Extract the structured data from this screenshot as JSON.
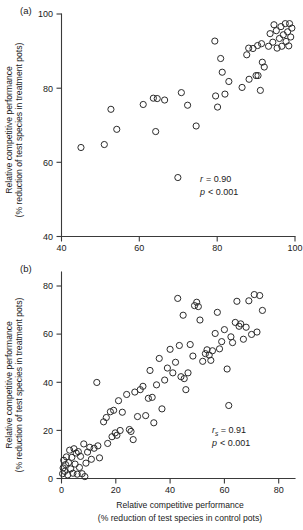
{
  "figure": {
    "type": "scatter-figure",
    "panels": [
      {
        "label": "(a)",
        "ylabel_line1": "Relative competitive performance",
        "ylabel_line2": "(% reduction of test species in treatment pots)",
        "stat_symbol": "r",
        "stat_sub": "",
        "stat_value": "= 0.90",
        "stat_line1": "r = 0.90",
        "stat_line2": "p < 0.001",
        "p_symbol": "p",
        "p_value": "< 0.001",
        "xticks": [
          "40",
          "60",
          "80",
          "100"
        ],
        "yticks": [
          "40",
          "60",
          "80",
          "100"
        ]
      },
      {
        "label": "(b)",
        "ylabel_line1": "Relative competitive performance",
        "ylabel_line2": "(% reduction of test species in treatment pots)",
        "xlabel_line1": "Relative competitive performance",
        "xlabel_line2": "(% reduction of test species in control pots)",
        "stat_symbol": "r",
        "stat_sub": "s",
        "stat_value": "= 0.91",
        "stat_line1": "rs = 0.91",
        "stat_line2": "p < 0.001",
        "p_symbol": "p",
        "p_value": "< 0.001",
        "xticks": [
          "0",
          "20",
          "40",
          "60",
          "80"
        ],
        "yticks": [
          "0",
          "20",
          "40",
          "60",
          "80"
        ]
      }
    ]
  },
  "chart_data": [
    {
      "type": "scatter",
      "panel": "(a)",
      "title": "",
      "xlabel": "Relative competitive performance (% reduction of test species in control pots)",
      "ylabel": "Relative competitive performance (% reduction of test species in treatment pots)",
      "xlim": [
        40,
        100
      ],
      "ylim": [
        40,
        100
      ],
      "xticks": [
        40,
        60,
        80,
        100
      ],
      "yticks": [
        40,
        60,
        80,
        100
      ],
      "grid": false,
      "legend": "none",
      "marker": "open-circle",
      "annotations": [
        "r = 0.90",
        "p < 0.001"
      ],
      "points": [
        [
          45.0,
          64.0
        ],
        [
          51.0,
          64.8
        ],
        [
          52.7,
          74.3
        ],
        [
          54.2,
          68.9
        ],
        [
          61.0,
          75.6
        ],
        [
          63.6,
          77.3
        ],
        [
          64.6,
          77.2
        ],
        [
          64.2,
          68.3
        ],
        [
          66.5,
          76.8
        ],
        [
          69.9,
          55.9
        ],
        [
          70.8,
          78.8
        ],
        [
          72.4,
          75.4
        ],
        [
          74.6,
          69.8
        ],
        [
          79.4,
          92.7
        ],
        [
          79.6,
          77.9
        ],
        [
          80.1,
          74.9
        ],
        [
          80.9,
          88.0
        ],
        [
          81.3,
          84.3
        ],
        [
          82.0,
          78.4
        ],
        [
          83.0,
          81.8
        ],
        [
          86.4,
          80.2
        ],
        [
          87.6,
          89.0
        ],
        [
          88.2,
          82.4
        ],
        [
          88.1,
          90.8
        ],
        [
          89.2,
          90.7
        ],
        [
          90.0,
          83.4
        ],
        [
          90.5,
          83.4
        ],
        [
          90.4,
          91.5
        ],
        [
          91.1,
          79.4
        ],
        [
          91.6,
          87.0
        ],
        [
          91.4,
          92.0
        ],
        [
          92.1,
          85.7
        ],
        [
          93.2,
          91.3
        ],
        [
          93.6,
          94.7
        ],
        [
          94.3,
          92.4
        ],
        [
          94.6,
          97.1
        ],
        [
          95.2,
          95.5
        ],
        [
          95.4,
          90.8
        ],
        [
          96.0,
          93.4
        ],
        [
          96.4,
          96.6
        ],
        [
          96.6,
          91.3
        ],
        [
          97.0,
          94.4
        ],
        [
          97.5,
          97.4
        ],
        [
          97.7,
          92.6
        ],
        [
          98.1,
          95.2
        ],
        [
          98.6,
          97.4
        ],
        [
          98.4,
          91.4
        ],
        [
          98.9,
          93.8
        ],
        [
          99.2,
          96.2
        ]
      ]
    },
    {
      "type": "scatter",
      "panel": "(b)",
      "title": "",
      "xlabel": "Relative competitive performance (% reduction of test species in control pots)",
      "ylabel": "Relative competitive performance (% reduction of test species in treatment pots)",
      "xlim": [
        0,
        86
      ],
      "ylim": [
        0,
        86
      ],
      "xticks": [
        0,
        20,
        40,
        60,
        80
      ],
      "yticks": [
        0,
        20,
        40,
        60,
        80
      ],
      "grid": false,
      "legend": "none",
      "marker": "open-circle",
      "annotations": [
        "rs = 0.91",
        "p < 0.001"
      ],
      "points": [
        [
          0.4,
          2.0
        ],
        [
          0.6,
          4.4
        ],
        [
          0.8,
          7.6
        ],
        [
          1.2,
          3.0
        ],
        [
          1.5,
          5.8
        ],
        [
          1.8,
          9.0
        ],
        [
          2.3,
          1.5
        ],
        [
          2.6,
          6.6
        ],
        [
          3.0,
          11.8
        ],
        [
          3.4,
          4.0
        ],
        [
          3.8,
          8.8
        ],
        [
          4.2,
          2.2
        ],
        [
          4.6,
          12.4
        ],
        [
          5.0,
          6.0
        ],
        [
          5.4,
          10.6
        ],
        [
          5.8,
          1.8
        ],
        [
          6.2,
          11.2
        ],
        [
          6.6,
          4.6
        ],
        [
          7.0,
          9.2
        ],
        [
          7.6,
          2.0
        ],
        [
          8.2,
          14.4
        ],
        [
          8.6,
          0.8
        ],
        [
          9.0,
          6.4
        ],
        [
          9.6,
          11.0
        ],
        [
          10.4,
          13.0
        ],
        [
          11.0,
          8.0
        ],
        [
          12.0,
          12.6
        ],
        [
          13.0,
          40.0
        ],
        [
          13.4,
          13.6
        ],
        [
          14.0,
          8.6
        ],
        [
          15.5,
          23.6
        ],
        [
          16.5,
          25.4
        ],
        [
          17.0,
          14.6
        ],
        [
          18.0,
          27.8
        ],
        [
          18.6,
          17.4
        ],
        [
          19.2,
          28.4
        ],
        [
          19.8,
          19.0
        ],
        [
          20.4,
          18.0
        ],
        [
          21.0,
          32.4
        ],
        [
          21.6,
          20.0
        ],
        [
          22.4,
          27.6
        ],
        [
          24.0,
          35.0
        ],
        [
          25.0,
          20.4
        ],
        [
          25.6,
          19.6
        ],
        [
          26.4,
          16.2
        ],
        [
          27.0,
          36.0
        ],
        [
          28.0,
          25.8
        ],
        [
          29.0,
          37.0
        ],
        [
          30.0,
          38.4
        ],
        [
          31.0,
          26.2
        ],
        [
          32.0,
          33.4
        ],
        [
          32.6,
          45.0
        ],
        [
          33.4,
          33.8
        ],
        [
          34.0,
          23.2
        ],
        [
          35.0,
          39.0
        ],
        [
          36.0,
          50.0
        ],
        [
          37.0,
          29.0
        ],
        [
          38.0,
          41.0
        ],
        [
          39.0,
          46.0
        ],
        [
          40.0,
          53.8
        ],
        [
          41.0,
          44.0
        ],
        [
          42.0,
          48.4
        ],
        [
          42.8,
          75.0
        ],
        [
          43.4,
          55.4
        ],
        [
          44.0,
          42.4
        ],
        [
          44.8,
          68.0
        ],
        [
          45.2,
          41.6
        ],
        [
          45.8,
          37.0
        ],
        [
          46.6,
          44.0
        ],
        [
          47.4,
          55.8
        ],
        [
          48.4,
          51.0
        ],
        [
          49.0,
          72.0
        ],
        [
          49.8,
          73.4
        ],
        [
          50.4,
          71.6
        ],
        [
          51.0,
          66.0
        ],
        [
          52.0,
          48.8
        ],
        [
          53.0,
          52.0
        ],
        [
          53.6,
          53.6
        ],
        [
          54.4,
          51.4
        ],
        [
          55.0,
          49.2
        ],
        [
          55.6,
          53.2
        ],
        [
          56.6,
          60.4
        ],
        [
          57.4,
          69.2
        ],
        [
          58.2,
          54.0
        ],
        [
          59.0,
          57.0
        ],
        [
          60.0,
          62.0
        ],
        [
          61.0,
          45.6
        ],
        [
          61.6,
          30.4
        ],
        [
          62.4,
          59.0
        ],
        [
          63.0,
          56.6
        ],
        [
          64.0,
          65.0
        ],
        [
          64.6,
          73.8
        ],
        [
          65.4,
          63.4
        ],
        [
          66.0,
          64.4
        ],
        [
          67.0,
          58.0
        ],
        [
          68.0,
          63.0
        ],
        [
          69.0,
          74.0
        ],
        [
          70.0,
          60.0
        ],
        [
          71.0,
          76.6
        ],
        [
          72.0,
          61.0
        ],
        [
          73.0,
          76.2
        ],
        [
          74.0,
          70.0
        ]
      ]
    }
  ]
}
